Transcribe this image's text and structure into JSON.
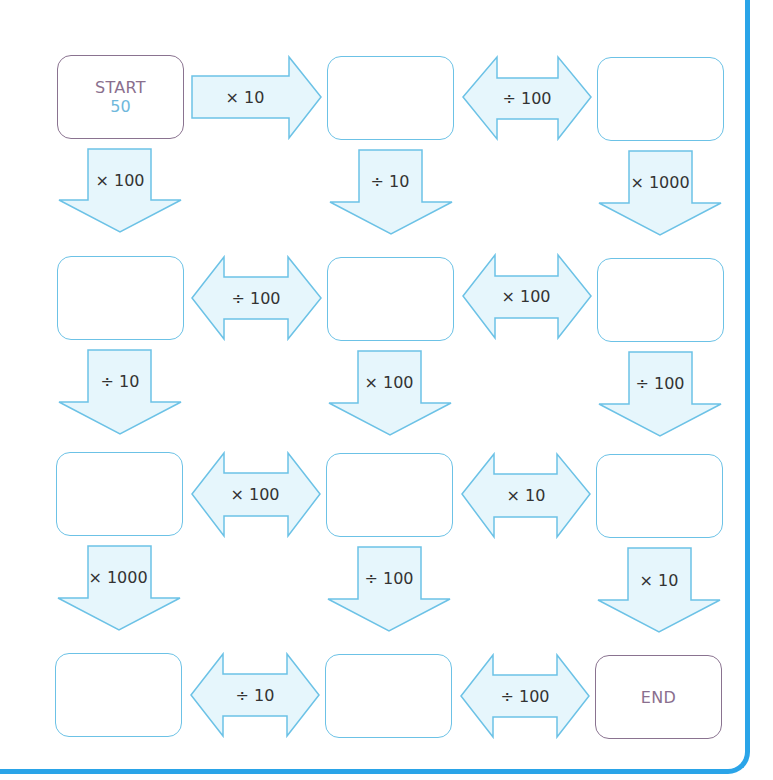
{
  "puzzle": {
    "start": {
      "label": "START",
      "value": "50"
    },
    "end": {
      "label": "END"
    },
    "colors": {
      "frame": "#2aa4e8",
      "box_border": "#6cc2e6",
      "terminal_border": "#8a7390",
      "arrow_fill": "#e6f6fc",
      "arrow_stroke": "#6cc2e6",
      "start_value": "#6fb8dc"
    },
    "rows": [
      {
        "boxes": [
          "START 50",
          "",
          ""
        ],
        "horizontal_ops": [
          {
            "label": "× 10",
            "type": "right"
          },
          {
            "label": "÷ 100",
            "type": "double"
          }
        ],
        "down_ops": [
          "× 100",
          "÷ 10",
          "× 1000"
        ]
      },
      {
        "boxes": [
          "",
          "",
          ""
        ],
        "horizontal_ops": [
          {
            "label": "÷ 100",
            "type": "double"
          },
          {
            "label": "× 100",
            "type": "double"
          }
        ],
        "down_ops": [
          "÷ 10",
          "× 100",
          "÷ 100"
        ]
      },
      {
        "boxes": [
          "",
          "",
          ""
        ],
        "horizontal_ops": [
          {
            "label": "× 100",
            "type": "double"
          },
          {
            "label": "× 10",
            "type": "double"
          }
        ],
        "down_ops": [
          "× 1000",
          "÷ 100",
          "× 10"
        ]
      },
      {
        "boxes": [
          "",
          "",
          "END"
        ],
        "horizontal_ops": [
          {
            "label": "÷ 10",
            "type": "double"
          },
          {
            "label": "÷ 100",
            "type": "double"
          }
        ],
        "down_ops": []
      }
    ]
  }
}
